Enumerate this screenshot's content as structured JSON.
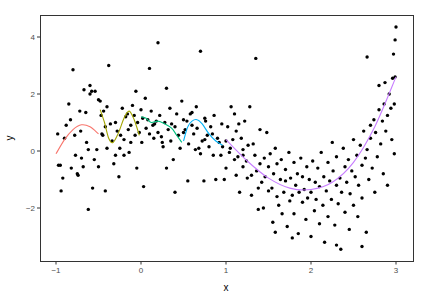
{
  "chart_data": {
    "type": "scatter",
    "title": "",
    "xlabel": "x",
    "ylabel": "y",
    "xlim": [
      -1.2,
      3.2
    ],
    "ylim": [
      -3.8,
      4.8
    ],
    "x_ticks": [
      -1,
      0,
      1,
      2,
      3
    ],
    "x_tick_labels": [
      "-1",
      "0",
      "1",
      "2",
      "3"
    ],
    "y_ticks": [
      -2,
      0,
      2,
      4
    ],
    "y_tick_labels": [
      "-2",
      "0",
      "2",
      "4"
    ],
    "grid": false,
    "legend": "none",
    "points": [
      [
        -0.98,
        0.6
      ],
      [
        -0.97,
        -0.5
      ],
      [
        -0.95,
        -0.5
      ],
      [
        -0.94,
        -1.4
      ],
      [
        -0.92,
        -0.95
      ],
      [
        -0.9,
        0.45
      ],
      [
        -0.88,
        0.9
      ],
      [
        -0.85,
        1.65
      ],
      [
        -0.83,
        1.1
      ],
      [
        -0.8,
        2.85
      ],
      [
        -0.82,
        -0.6
      ],
      [
        -0.78,
        0.55
      ],
      [
        -0.77,
        -0.15
      ],
      [
        -0.75,
        -0.8
      ],
      [
        -0.74,
        -0.85
      ],
      [
        -0.72,
        1.4
      ],
      [
        -0.71,
        0.7
      ],
      [
        -0.7,
        -0.25
      ],
      [
        -0.68,
        -0.55
      ],
      [
        -0.67,
        2.15
      ],
      [
        -0.65,
        1.35
      ],
      [
        -0.64,
        0.3
      ],
      [
        -0.62,
        0.05
      ],
      [
        -0.6,
        2.3
      ],
      [
        -0.6,
        2.0
      ],
      [
        -0.58,
        2.1
      ],
      [
        -0.57,
        -1.3
      ],
      [
        -0.55,
        -0.3
      ],
      [
        -0.54,
        2.1
      ],
      [
        -0.52,
        0.05
      ],
      [
        -0.5,
        -0.55
      ],
      [
        -0.5,
        1.8
      ],
      [
        -0.48,
        1.75
      ],
      [
        -0.47,
        1.25
      ],
      [
        -0.46,
        0.6
      ],
      [
        -0.45,
        0.55
      ],
      [
        -0.44,
        1.4
      ],
      [
        -0.42,
        -1.4
      ],
      [
        -0.42,
        0.85
      ],
      [
        -0.62,
        -2.05
      ],
      [
        -0.4,
        1.55
      ],
      [
        -0.4,
        0.1
      ],
      [
        -0.38,
        3.0
      ],
      [
        -0.36,
        0.95
      ],
      [
        -0.34,
        0.35
      ],
      [
        -0.32,
        -0.45
      ],
      [
        -0.3,
        1.0
      ],
      [
        -0.3,
        -0.15
      ],
      [
        -0.28,
        0.7
      ],
      [
        -0.26,
        -0.9
      ],
      [
        -0.25,
        0.1
      ],
      [
        -0.24,
        0.55
      ],
      [
        -0.22,
        1.5
      ],
      [
        -0.2,
        0.4
      ],
      [
        -0.2,
        -0.15
      ],
      [
        -0.18,
        1.2
      ],
      [
        -0.16,
        1.3
      ],
      [
        -0.15,
        0.75
      ],
      [
        -0.14,
        -0.05
      ],
      [
        -0.12,
        0.3
      ],
      [
        -0.12,
        0.9
      ],
      [
        -0.1,
        1.6
      ],
      [
        -0.08,
        1.25
      ],
      [
        -0.07,
        0.55
      ],
      [
        -0.06,
        2.1
      ],
      [
        -0.05,
        -0.6
      ],
      [
        -0.04,
        1.0
      ],
      [
        -0.02,
        0.65
      ],
      [
        0.0,
        1.45
      ],
      [
        0.01,
        0.3
      ],
      [
        0.02,
        1.15
      ],
      [
        0.03,
        -1.25
      ],
      [
        0.05,
        1.85
      ],
      [
        0.06,
        0.8
      ],
      [
        0.08,
        1.1
      ],
      [
        0.1,
        2.9
      ],
      [
        0.1,
        0.6
      ],
      [
        0.12,
        1.4
      ],
      [
        0.14,
        0.9
      ],
      [
        0.15,
        0.45
      ],
      [
        0.16,
        0.95
      ],
      [
        0.18,
        1.05
      ],
      [
        0.2,
        3.8
      ],
      [
        0.2,
        0.65
      ],
      [
        0.22,
        1.25
      ],
      [
        0.24,
        0.5
      ],
      [
        0.25,
        0.3
      ],
      [
        0.26,
        0.15
      ],
      [
        0.28,
        1.0
      ],
      [
        0.3,
        -0.6
      ],
      [
        0.3,
        2.2
      ],
      [
        0.32,
        0.75
      ],
      [
        0.34,
        1.5
      ],
      [
        0.35,
        0.35
      ],
      [
        0.36,
        0.95
      ],
      [
        0.38,
        -0.3
      ],
      [
        0.4,
        0.85
      ],
      [
        0.4,
        -1.45
      ],
      [
        0.42,
        1.3
      ],
      [
        0.44,
        0.55
      ],
      [
        0.46,
        0.1
      ],
      [
        0.48,
        1.75
      ],
      [
        0.5,
        1.1
      ],
      [
        0.5,
        0.65
      ],
      [
        0.52,
        0.75
      ],
      [
        0.54,
        1.05
      ],
      [
        0.55,
        -1.05
      ],
      [
        0.56,
        0.25
      ],
      [
        0.58,
        1.3
      ],
      [
        0.6,
        1.35
      ],
      [
        0.6,
        0.9
      ],
      [
        0.62,
        0.6
      ],
      [
        0.64,
        0.05
      ],
      [
        0.65,
        1.55
      ],
      [
        0.66,
        0.8
      ],
      [
        0.68,
        0.1
      ],
      [
        0.7,
        3.5
      ],
      [
        0.7,
        -0.1
      ],
      [
        0.72,
        0.35
      ],
      [
        0.74,
        -1.05
      ],
      [
        0.75,
        0.4
      ],
      [
        0.76,
        1.05
      ],
      [
        0.78,
        0.55
      ],
      [
        0.8,
        0.15
      ],
      [
        0.82,
        0.85
      ],
      [
        0.84,
        0.6
      ],
      [
        0.85,
        -0.15
      ],
      [
        0.86,
        1.25
      ],
      [
        0.88,
        -1.0
      ],
      [
        0.9,
        0.45
      ],
      [
        0.92,
        0.3
      ],
      [
        0.94,
        -0.15
      ],
      [
        0.95,
        0.95
      ],
      [
        0.96,
        0.15
      ],
      [
        0.98,
        -1.0
      ],
      [
        1.0,
        0.35
      ],
      [
        1.0,
        -0.6
      ],
      [
        1.02,
        0.85
      ],
      [
        1.04,
        -0.05
      ],
      [
        1.05,
        0.1
      ],
      [
        1.06,
        1.55
      ],
      [
        1.08,
        0.4
      ],
      [
        1.1,
        -0.3
      ],
      [
        1.12,
        -0.85
      ],
      [
        1.12,
        0.7
      ],
      [
        1.14,
        -0.2
      ],
      [
        1.15,
        0.95
      ],
      [
        1.16,
        -1.45
      ],
      [
        1.18,
        0.45
      ],
      [
        1.2,
        0.05
      ],
      [
        1.2,
        -0.55
      ],
      [
        1.22,
        1.05
      ],
      [
        1.24,
        -0.35
      ],
      [
        1.25,
        -0.95
      ],
      [
        1.26,
        0.2
      ],
      [
        1.28,
        1.55
      ],
      [
        1.3,
        -0.85
      ],
      [
        1.3,
        -1.55
      ],
      [
        1.32,
        0.25
      ],
      [
        1.34,
        -0.15
      ],
      [
        1.35,
        3.25
      ],
      [
        1.36,
        -0.7
      ],
      [
        1.38,
        -2.05
      ],
      [
        1.38,
        -1.3
      ],
      [
        1.4,
        0.75
      ],
      [
        1.4,
        -0.45
      ],
      [
        1.42,
        -1.1
      ],
      [
        1.44,
        -2.0
      ],
      [
        1.45,
        -0.25
      ],
      [
        1.46,
        -0.9
      ],
      [
        1.48,
        0.65
      ],
      [
        1.5,
        -0.55
      ],
      [
        1.5,
        -1.4
      ],
      [
        1.52,
        -0.1
      ],
      [
        1.54,
        -1.3
      ],
      [
        1.55,
        -2.5
      ],
      [
        1.56,
        -0.8
      ],
      [
        1.58,
        0.1
      ],
      [
        1.6,
        -1.6
      ],
      [
        1.6,
        -0.45
      ],
      [
        1.62,
        -1.9
      ],
      [
        1.64,
        -1.0
      ],
      [
        1.65,
        -0.3
      ],
      [
        1.66,
        -2.2
      ],
      [
        1.68,
        -1.45
      ],
      [
        1.7,
        -0.65
      ],
      [
        1.7,
        -1.05
      ],
      [
        1.72,
        -2.65
      ],
      [
        1.74,
        -0.05
      ],
      [
        1.75,
        -1.75
      ],
      [
        1.76,
        -0.95
      ],
      [
        1.78,
        -1.55
      ],
      [
        1.8,
        -0.4
      ],
      [
        1.8,
        -2.2
      ],
      [
        1.82,
        -1.2
      ],
      [
        1.84,
        -0.8
      ],
      [
        1.85,
        -2.9
      ],
      [
        1.86,
        -1.45
      ],
      [
        1.88,
        -0.25
      ],
      [
        1.9,
        -1.8
      ],
      [
        1.9,
        -0.9
      ],
      [
        1.92,
        -1.35
      ],
      [
        1.94,
        -2.4
      ],
      [
        1.95,
        -0.55
      ],
      [
        1.96,
        -1.65
      ],
      [
        1.98,
        -1.0
      ],
      [
        2.0,
        -3.0
      ],
      [
        2.0,
        -1.45
      ],
      [
        2.02,
        -0.35
      ],
      [
        2.04,
        -2.1
      ],
      [
        2.05,
        -1.1
      ],
      [
        2.06,
        -1.7
      ],
      [
        2.08,
        -0.6
      ],
      [
        2.1,
        -2.55
      ],
      [
        2.1,
        -1.25
      ],
      [
        2.12,
        -0.05
      ],
      [
        2.14,
        -1.9
      ],
      [
        2.15,
        -0.9
      ],
      [
        2.16,
        -3.2
      ],
      [
        2.18,
        -1.4
      ],
      [
        2.2,
        -0.4
      ],
      [
        2.2,
        -2.3
      ],
      [
        2.22,
        -1.05
      ],
      [
        2.24,
        -1.7
      ],
      [
        2.25,
        0.3
      ],
      [
        2.26,
        -0.7
      ],
      [
        2.28,
        -2.6
      ],
      [
        2.3,
        -1.2
      ],
      [
        2.3,
        -0.2
      ],
      [
        2.32,
        -1.85
      ],
      [
        2.34,
        -0.95
      ],
      [
        2.35,
        -3.45
      ],
      [
        2.36,
        -1.45
      ],
      [
        2.38,
        0.1
      ],
      [
        2.4,
        -0.55
      ],
      [
        2.4,
        -2.15
      ],
      [
        2.42,
        -1.1
      ],
      [
        2.44,
        -0.3
      ],
      [
        2.45,
        -2.75
      ],
      [
        2.46,
        -1.5
      ],
      [
        2.48,
        -0.7
      ],
      [
        2.5,
        0.4
      ],
      [
        2.5,
        -1.9
      ],
      [
        2.52,
        -0.9
      ],
      [
        2.54,
        -0.15
      ],
      [
        2.55,
        -2.3
      ],
      [
        2.56,
        -1.2
      ],
      [
        2.58,
        0.2
      ],
      [
        2.6,
        -0.5
      ],
      [
        2.6,
        -1.65
      ],
      [
        2.62,
        0.7
      ],
      [
        2.64,
        -0.25
      ],
      [
        2.65,
        -2.85
      ],
      [
        2.66,
        0.05
      ],
      [
        2.68,
        -1.0
      ],
      [
        2.7,
        0.9
      ],
      [
        2.7,
        0.45
      ],
      [
        2.72,
        -0.6
      ],
      [
        2.74,
        1.1
      ],
      [
        2.75,
        -1.45
      ],
      [
        2.76,
        0.65
      ],
      [
        2.78,
        -0.2
      ],
      [
        2.8,
        1.45
      ],
      [
        2.8,
        2.3
      ],
      [
        2.82,
        0.25
      ],
      [
        2.84,
        1.05
      ],
      [
        2.85,
        -0.8
      ],
      [
        2.86,
        1.65
      ],
      [
        2.88,
        0.7
      ],
      [
        2.9,
        1.25
      ],
      [
        2.9,
        -1.2
      ],
      [
        2.92,
        2.0
      ],
      [
        2.94,
        1.5
      ],
      [
        2.95,
        0.4
      ],
      [
        2.96,
        2.55
      ],
      [
        2.97,
        3.4
      ],
      [
        2.98,
        1.65
      ],
      [
        2.98,
        -0.1
      ],
      [
        2.99,
        3.9
      ],
      [
        3.0,
        4.35
      ],
      [
        2.99,
        2.6
      ],
      [
        2.87,
        2.4
      ],
      [
        2.66,
        3.3
      ],
      [
        2.3,
        -3.3
      ],
      [
        2.6,
        -3.35
      ],
      [
        1.78,
        -3.05
      ],
      [
        1.58,
        -2.85
      ],
      [
        1.2,
        -0.15
      ],
      [
        1.1,
        1.3
      ],
      [
        0.75,
        1.15
      ]
    ],
    "series": [
      {
        "name": "segment-1",
        "color": "#F8766D",
        "x_range": [
          -1.0,
          -0.5
        ],
        "x": [
          -1.0,
          -0.9,
          -0.8,
          -0.7,
          -0.6,
          -0.5
        ],
        "y": [
          -0.1,
          0.4,
          0.75,
          0.92,
          0.85,
          0.6
        ]
      },
      {
        "name": "segment-2",
        "color": "#A3A500",
        "x_range": [
          -0.5,
          0.0
        ],
        "x": [
          -0.48,
          -0.43,
          -0.38,
          -0.33,
          -0.27,
          -0.2,
          -0.14,
          -0.08,
          -0.02
        ],
        "y": [
          1.45,
          1.0,
          0.45,
          0.3,
          0.6,
          1.15,
          1.4,
          1.1,
          0.55
        ]
      },
      {
        "name": "segment-3",
        "color": "#00BF7D",
        "x_range": [
          0.0,
          0.5
        ],
        "x": [
          0.0,
          0.06,
          0.12,
          0.2,
          0.28,
          0.36,
          0.42,
          0.48
        ],
        "y": [
          1.2,
          1.15,
          1.0,
          1.05,
          0.95,
          0.8,
          0.55,
          0.3
        ]
      },
      {
        "name": "segment-4",
        "color": "#00B0F6",
        "x_range": [
          0.5,
          1.0
        ],
        "x": [
          0.5,
          0.55,
          0.6,
          0.66,
          0.72,
          0.8,
          0.88,
          0.96
        ],
        "y": [
          0.35,
          0.85,
          1.05,
          1.1,
          0.95,
          0.6,
          0.35,
          0.2
        ]
      },
      {
        "name": "segment-5",
        "color": "#C77CFF",
        "x_range": [
          1.0,
          3.0
        ],
        "x": [
          1.0,
          1.25,
          1.5,
          1.75,
          2.0,
          2.25,
          2.5,
          2.75,
          3.0
        ],
        "y": [
          0.4,
          -0.35,
          -0.95,
          -1.3,
          -1.35,
          -1.1,
          -0.4,
          0.85,
          2.6
        ]
      }
    ]
  }
}
